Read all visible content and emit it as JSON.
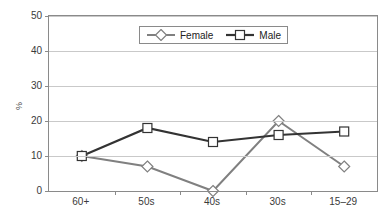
{
  "chart_data": {
    "type": "line",
    "title": "",
    "xlabel": "",
    "ylabel": "%",
    "categories": [
      "60+",
      "50s",
      "40s",
      "30s",
      "15–29"
    ],
    "ylim": [
      0,
      50
    ],
    "yticks": [
      0,
      10,
      20,
      30,
      40,
      50
    ],
    "grid": true,
    "legend_position": "top-center",
    "series": [
      {
        "name": "Female",
        "color": "#808080",
        "marker": "diamond",
        "values": [
          10,
          7,
          0,
          20,
          7
        ]
      },
      {
        "name": "Male",
        "color": "#333333",
        "marker": "square",
        "values": [
          10,
          18,
          14,
          16,
          17
        ]
      }
    ]
  },
  "axis": {
    "y_title": "%",
    "y_tick_labels": [
      "0",
      "10",
      "20",
      "30",
      "40",
      "50"
    ],
    "x_tick_labels": [
      "60+",
      "50s",
      "40s",
      "30s",
      "15–29"
    ]
  },
  "legend": {
    "entries": [
      {
        "label": "Female",
        "icon": "line-diamond-marker"
      },
      {
        "label": "Male",
        "icon": "line-square-marker"
      }
    ]
  }
}
